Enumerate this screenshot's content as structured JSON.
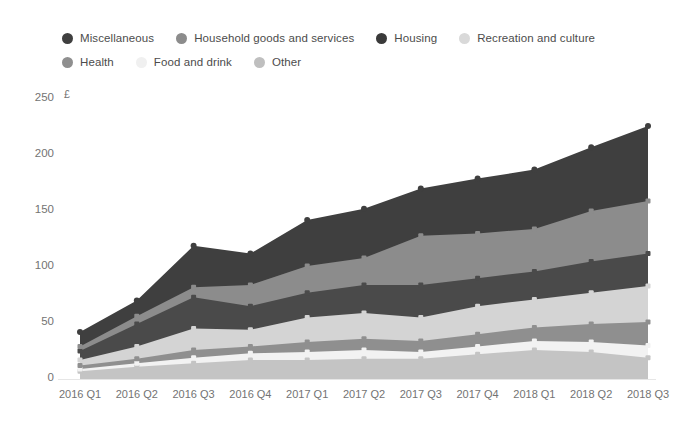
{
  "chart_data": {
    "type": "area",
    "stacked": true,
    "title": "",
    "subtitle": "",
    "xlabel": "",
    "ylabel": "£",
    "unit_label": "£",
    "ylim": [
      0,
      250
    ],
    "yticks": [
      0,
      50,
      100,
      150,
      200,
      250
    ],
    "ytick_labels": [
      "0",
      "50",
      "100",
      "150",
      "200",
      "250"
    ],
    "grid": false,
    "legend_position": "top",
    "categories": [
      "2016 Q1",
      "2016 Q2",
      "2016 Q3",
      "2016 Q4",
      "2017 Q1",
      "2017 Q2",
      "2017 Q3",
      "2017 Q4",
      "2018 Q1",
      "2018 Q2",
      "2018 Q3"
    ],
    "series": [
      {
        "name": "Miscellaneous",
        "color": "#3f3f3f",
        "values": [
          13,
          14,
          37,
          28,
          41,
          44,
          42,
          49,
          53,
          57,
          67
        ]
      },
      {
        "name": "Household goods and services",
        "color": "#8c8c8c",
        "values": [
          4,
          7,
          9,
          19,
          24,
          24,
          44,
          40,
          38,
          45,
          47
        ]
      },
      {
        "name": "Housing",
        "color": "#4a4a4a",
        "values": [
          8,
          20,
          28,
          21,
          22,
          25,
          29,
          25,
          25,
          28,
          29
        ]
      },
      {
        "name": "Recreation and culture",
        "color": "#d4d4d4",
        "values": [
          5,
          11,
          19,
          15,
          22,
          23,
          21,
          25,
          25,
          28,
          32
        ]
      },
      {
        "name": "Health",
        "color": "#8f8f8f",
        "values": [
          3,
          4,
          7,
          6,
          9,
          10,
          10,
          11,
          12,
          16,
          21
        ]
      },
      {
        "name": "Food and drink",
        "color": "#f2f2f2",
        "values": [
          2,
          3,
          5,
          6,
          7,
          8,
          6,
          7,
          8,
          9,
          11
        ]
      },
      {
        "name": "Other",
        "color": "#c4c4c4",
        "values": [
          7,
          11,
          14,
          17,
          17,
          18,
          18,
          22,
          26,
          24,
          19
        ]
      }
    ],
    "totals": [
      42,
      70,
      119,
      112,
      142,
      152,
      170,
      179,
      187,
      207,
      226
    ]
  },
  "legend": {
    "items": [
      {
        "label": "Miscellaneous",
        "color": "#3f3f3f"
      },
      {
        "label": "Household goods and services",
        "color": "#8c8c8c"
      },
      {
        "label": "Housing",
        "color": "#3a3a3a"
      },
      {
        "label": "Recreation and culture",
        "color": "#d9d9d9"
      },
      {
        "label": "Health",
        "color": "#8f8f8f"
      },
      {
        "label": "Food and drink",
        "color": "#f0f0f0"
      },
      {
        "label": "Other",
        "color": "#bfbfbf"
      }
    ]
  },
  "axes": {
    "y_unit": "£",
    "y_labels": [
      "250",
      "200",
      "150",
      "100",
      "50",
      "0"
    ],
    "x_labels": [
      "2016 Q1",
      "2016 Q2",
      "2016 Q3",
      "2016 Q4",
      "2017 Q1",
      "2017 Q2",
      "2017 Q3",
      "2017 Q4",
      "2018 Q1",
      "2018 Q2",
      "2018 Q3"
    ]
  }
}
